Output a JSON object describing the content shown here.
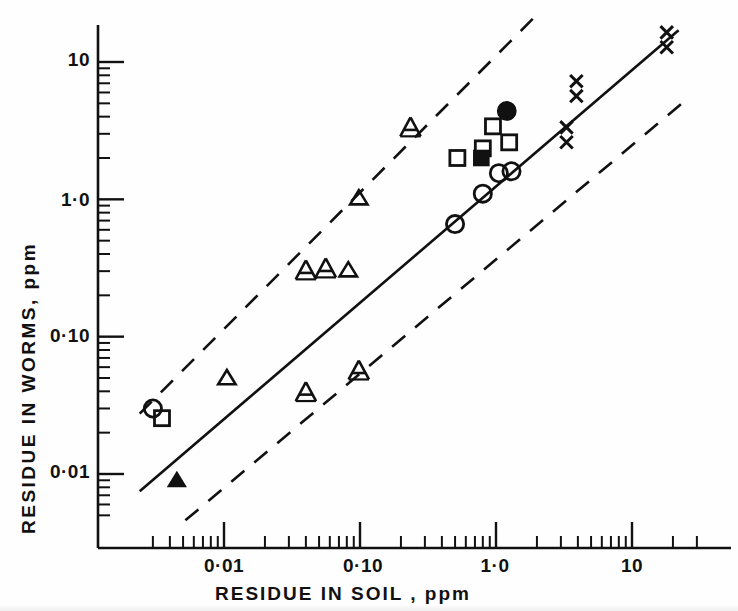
{
  "figure": {
    "background": "#fefefe",
    "ink_color": "#111111",
    "width": 738,
    "height": 611
  },
  "axes": {
    "x": {
      "title": "RESIDUE  IN  SOIL ,    ppm",
      "tick_labels": [
        "0·01",
        "0·10",
        "1·0",
        "10"
      ],
      "tick_values": [
        0.01,
        0.1,
        1,
        10
      ],
      "tick_pixels": [
        224,
        363,
        495,
        632
      ],
      "scale": "log",
      "range": [
        0.0022,
        32
      ],
      "minor_ticks": true
    },
    "y": {
      "title": "RESIDUE  IN  WORMS,   ppm",
      "tick_labels": [
        "10",
        "1·0",
        "0·10",
        "0·01"
      ],
      "tick_values": [
        10,
        1,
        0.1,
        0.01
      ],
      "tick_pixels": [
        62,
        202,
        338,
        474
      ],
      "scale": "log",
      "range": [
        0.0042,
        21
      ],
      "minor_ticks": true
    },
    "spine_color": "#111111",
    "frame": {
      "left": 98,
      "top": 25,
      "bottom": 548,
      "right": 731
    }
  },
  "chart_data": {
    "type": "scatter",
    "title": "",
    "xlabel": "RESIDUE  IN  SOIL ,    ppm",
    "ylabel": "RESIDUE  IN  WORMS,   ppm",
    "xscale": "log",
    "yscale": "log",
    "xlim": [
      0.0022,
      32
    ],
    "ylim": [
      0.0042,
      21
    ],
    "grid": false,
    "legend": "none",
    "series": [
      {
        "name": "open-square",
        "marker": "open-square",
        "points": [
          {
            "x": 0.0035,
            "y": 0.0255
          },
          {
            "x": 0.52,
            "y": 2.0
          },
          {
            "x": 0.8,
            "y": 2.35
          },
          {
            "x": 0.95,
            "y": 3.4
          },
          {
            "x": 1.25,
            "y": 2.6
          }
        ]
      },
      {
        "name": "filled-square",
        "marker": "filled-square",
        "points": [
          {
            "x": 0.78,
            "y": 2.0
          }
        ]
      },
      {
        "name": "open-circle",
        "marker": "open-circle",
        "points": [
          {
            "x": 0.003,
            "y": 0.03
          },
          {
            "x": 0.5,
            "y": 0.66
          },
          {
            "x": 0.8,
            "y": 1.1
          },
          {
            "x": 1.05,
            "y": 1.55
          },
          {
            "x": 1.3,
            "y": 1.6
          }
        ]
      },
      {
        "name": "filled-circle",
        "marker": "filled-circle",
        "points": [
          {
            "x": 1.2,
            "y": 4.4
          }
        ]
      },
      {
        "name": "open-triangle",
        "marker": "open-triangle",
        "points": [
          {
            "x": 0.0105,
            "y": 0.05
          },
          {
            "x": 0.082,
            "y": 0.305
          },
          {
            "x": 0.098,
            "y": 1.02
          }
        ]
      },
      {
        "name": "filled-triangle",
        "marker": "filled-triangle",
        "points": [
          {
            "x": 0.0045,
            "y": 0.009
          }
        ]
      },
      {
        "name": "letter-A-triangle",
        "marker": "A-triangle",
        "points": [
          {
            "x": 0.04,
            "y": 0.3
          },
          {
            "x": 0.056,
            "y": 0.31
          },
          {
            "x": 0.235,
            "y": 3.3
          },
          {
            "x": 0.04,
            "y": 0.039
          },
          {
            "x": 0.098,
            "y": 0.056
          }
        ]
      },
      {
        "name": "x-cross-pair",
        "marker": "x-pair",
        "points": [
          {
            "x": 3.3,
            "y": 2.95
          },
          {
            "x": 3.9,
            "y": 6.4
          },
          {
            "x": 18.0,
            "y": 14.5
          }
        ]
      }
    ],
    "lines": [
      {
        "name": "regression-line",
        "style": "solid",
        "slope_loglog": 1.0,
        "from": {
          "x": 0.0024,
          "y": 0.0075
        },
        "to": {
          "x": 22.0,
          "y": 17.0
        }
      },
      {
        "name": "upper-confidence-limit",
        "style": "dashed",
        "slope_loglog": 1.0,
        "from": {
          "x": 0.0024,
          "y": 0.0275
        },
        "to": {
          "x": 1.9,
          "y": 21.0
        }
      },
      {
        "name": "lower-confidence-limit",
        "style": "dashed",
        "slope_loglog": 1.0,
        "from": {
          "x": 0.0052,
          "y": 0.0046
        },
        "to": {
          "x": 25.0,
          "y": 5.3
        }
      }
    ]
  }
}
